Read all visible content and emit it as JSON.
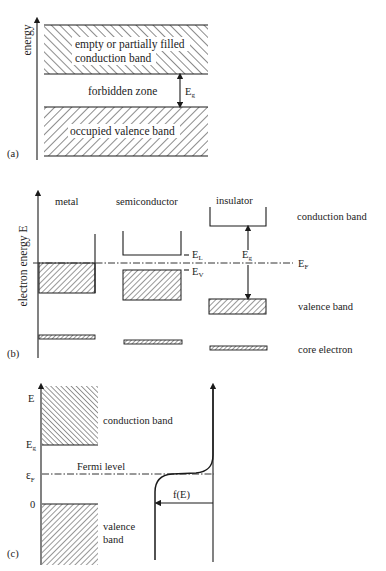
{
  "figure": {
    "panel_a": {
      "tag": "(a)",
      "axis_label": "energy",
      "conduction_band_label_line1": "empty or partially filled",
      "conduction_band_label_line2": "conduction band",
      "forbidden_zone_label": "forbidden zone",
      "gap_label": "E",
      "gap_label_sub": "g",
      "valence_band_label": "occupied valence band"
    },
    "panel_b": {
      "tag": "(b)",
      "axis_label": "electron energy E",
      "columns": [
        {
          "label": "metal"
        },
        {
          "label": "semiconductor"
        },
        {
          "label": "insulator"
        }
      ],
      "semiconductor_EL": "E",
      "semiconductor_EL_sub": "L",
      "semiconductor_EV": "E",
      "semiconductor_EV_sub": "V",
      "insulator_gap": "E",
      "insulator_gap_sub": "g",
      "fermi_label": "E",
      "fermi_label_sub": "F",
      "row_labels": {
        "conduction": "conduction band",
        "valence": "valence band",
        "core": "core electron"
      }
    },
    "panel_c": {
      "tag": "(c)",
      "tick_E": "E",
      "tick_Eg": "E",
      "tick_Eg_sub": "g",
      "tick_EF": "ε",
      "tick_EF_sub": "F",
      "tick_zero": "0",
      "conduction_band_label": "conduction band",
      "fermi_level_label": "Fermi level",
      "valence_label_line1": "valence",
      "valence_label_line2": "band",
      "distribution_label": "f(E)"
    }
  },
  "colors": {
    "ink": "#1a1a1a",
    "background": "#ffffff"
  }
}
